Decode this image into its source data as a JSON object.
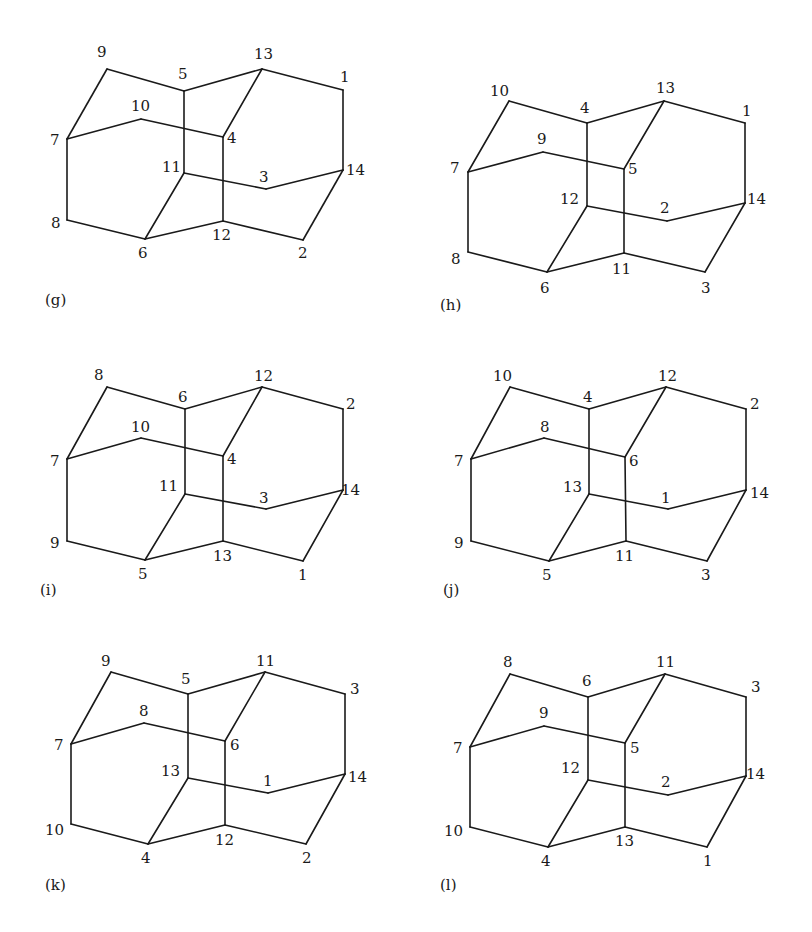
{
  "figure": {
    "edges_template": [
      [
        "A",
        "B"
      ],
      [
        "A",
        "C"
      ],
      [
        "C",
        "D"
      ],
      [
        "D",
        "E"
      ],
      [
        "E",
        "F"
      ],
      [
        "B",
        "G"
      ],
      [
        "G",
        "H"
      ],
      [
        "H",
        "D"
      ],
      [
        "C",
        "I"
      ],
      [
        "B",
        "J"
      ],
      [
        "J",
        "K"
      ],
      [
        "K",
        "I"
      ],
      [
        "I",
        "L"
      ],
      [
        "L",
        "F"
      ],
      [
        "F",
        "M"
      ],
      [
        "M",
        "N"
      ],
      [
        "N",
        "K"
      ],
      [
        "H",
        "N"
      ]
    ],
    "panels": [
      {
        "id": "g",
        "label": "(g)",
        "label_pos": [
          45,
          305
        ],
        "vertices": {
          "A": {
            "n": "9",
            "x": 107,
            "y": 69,
            "lx": 97,
            "ly": 57
          },
          "C": {
            "n": "5",
            "x": 184,
            "y": 91,
            "lx": 178,
            "ly": 79
          },
          "D": {
            "n": "13",
            "x": 262,
            "y": 69,
            "lx": 254,
            "ly": 59
          },
          "E": {
            "n": "1",
            "x": 343,
            "y": 90,
            "lx": 340,
            "ly": 82
          },
          "B": {
            "n": "7",
            "x": 67,
            "y": 139,
            "lx": 50,
            "ly": 145
          },
          "G": {
            "n": "10",
            "x": 141,
            "y": 119,
            "lx": 131,
            "ly": 111
          },
          "H": {
            "n": "4",
            "x": 223,
            "y": 137,
            "lx": 227,
            "ly": 143
          },
          "I": {
            "n": "11",
            "x": 184,
            "y": 173,
            "lx": 162,
            "ly": 172
          },
          "L": {
            "n": "3",
            "x": 266,
            "y": 189,
            "lx": 259,
            "ly": 182
          },
          "F": {
            "n": "14",
            "x": 343,
            "y": 170,
            "lx": 346,
            "ly": 175
          },
          "J": {
            "n": "8",
            "x": 67,
            "y": 220,
            "lx": 51,
            "ly": 228
          },
          "K": {
            "n": "6",
            "x": 145,
            "y": 239,
            "lx": 138,
            "ly": 258
          },
          "N": {
            "n": "12",
            "x": 223,
            "y": 221,
            "lx": 212,
            "ly": 240
          },
          "M": {
            "n": "2",
            "x": 303,
            "y": 240,
            "lx": 298,
            "ly": 258
          }
        }
      },
      {
        "id": "h",
        "label": "(h)",
        "label_pos": [
          440,
          310
        ],
        "vertices": {
          "A": {
            "n": "10",
            "x": 509,
            "y": 101,
            "lx": 490,
            "ly": 96
          },
          "C": {
            "n": "4",
            "x": 587,
            "y": 123,
            "lx": 580,
            "ly": 113
          },
          "D": {
            "n": "13",
            "x": 664,
            "y": 101,
            "lx": 656,
            "ly": 93
          },
          "E": {
            "n": "1",
            "x": 745,
            "y": 123,
            "lx": 742,
            "ly": 116
          },
          "B": {
            "n": "7",
            "x": 468,
            "y": 172,
            "lx": 450,
            "ly": 173
          },
          "G": {
            "n": "9",
            "x": 543,
            "y": 152,
            "lx": 537,
            "ly": 144
          },
          "H": {
            "n": "5",
            "x": 624,
            "y": 169,
            "lx": 628,
            "ly": 174
          },
          "I": {
            "n": "12",
            "x": 587,
            "y": 206,
            "lx": 560,
            "ly": 204
          },
          "L": {
            "n": "2",
            "x": 667,
            "y": 221,
            "lx": 660,
            "ly": 213
          },
          "F": {
            "n": "14",
            "x": 745,
            "y": 203,
            "lx": 747,
            "ly": 204
          },
          "J": {
            "n": "8",
            "x": 468,
            "y": 252,
            "lx": 451,
            "ly": 264
          },
          "K": {
            "n": "6",
            "x": 547,
            "y": 272,
            "lx": 540,
            "ly": 293
          },
          "N": {
            "n": "11",
            "x": 624,
            "y": 253,
            "lx": 612,
            "ly": 274
          },
          "M": {
            "n": "3",
            "x": 705,
            "y": 272,
            "lx": 701,
            "ly": 293
          }
        }
      },
      {
        "id": "i",
        "label": "(i)",
        "label_pos": [
          40,
          595
        ],
        "vertices": {
          "A": {
            "n": "8",
            "x": 107,
            "y": 387,
            "lx": 94,
            "ly": 380
          },
          "C": {
            "n": "6",
            "x": 185,
            "y": 409,
            "lx": 178,
            "ly": 402
          },
          "D": {
            "n": "12",
            "x": 262,
            "y": 387,
            "lx": 254,
            "ly": 381
          },
          "E": {
            "n": "2",
            "x": 343,
            "y": 409,
            "lx": 346,
            "ly": 409
          },
          "B": {
            "n": "7",
            "x": 67,
            "y": 459,
            "lx": 50,
            "ly": 466
          },
          "G": {
            "n": "10",
            "x": 141,
            "y": 438,
            "lx": 131,
            "ly": 432
          },
          "H": {
            "n": "4",
            "x": 223,
            "y": 456,
            "lx": 227,
            "ly": 464
          },
          "I": {
            "n": "11",
            "x": 185,
            "y": 494,
            "lx": 159,
            "ly": 491
          },
          "L": {
            "n": "3",
            "x": 266,
            "y": 509,
            "lx": 259,
            "ly": 503
          },
          "F": {
            "n": "14",
            "x": 343,
            "y": 490,
            "lx": 341,
            "ly": 495
          },
          "J": {
            "n": "9",
            "x": 67,
            "y": 541,
            "lx": 50,
            "ly": 548
          },
          "K": {
            "n": "5",
            "x": 145,
            "y": 560,
            "lx": 138,
            "ly": 579
          },
          "N": {
            "n": "13",
            "x": 223,
            "y": 541,
            "lx": 213,
            "ly": 561
          },
          "M": {
            "n": "1",
            "x": 303,
            "y": 561,
            "lx": 298,
            "ly": 580
          }
        }
      },
      {
        "id": "j",
        "label": "(j)",
        "label_pos": [
          443,
          595
        ],
        "vertices": {
          "A": {
            "n": "10",
            "x": 510,
            "y": 387,
            "lx": 493,
            "ly": 381
          },
          "C": {
            "n": "4",
            "x": 589,
            "y": 409,
            "lx": 583,
            "ly": 402
          },
          "D": {
            "n": "12",
            "x": 666,
            "y": 387,
            "lx": 658,
            "ly": 381
          },
          "E": {
            "n": "2",
            "x": 746,
            "y": 409,
            "lx": 750,
            "ly": 409
          },
          "B": {
            "n": "7",
            "x": 471,
            "y": 459,
            "lx": 454,
            "ly": 466
          },
          "G": {
            "n": "8",
            "x": 544,
            "y": 438,
            "lx": 540,
            "ly": 432
          },
          "H": {
            "n": "6",
            "x": 625,
            "y": 457,
            "lx": 629,
            "ly": 466
          },
          "I": {
            "n": "13",
            "x": 589,
            "y": 494,
            "lx": 563,
            "ly": 492
          },
          "L": {
            "n": "1",
            "x": 668,
            "y": 509,
            "lx": 661,
            "ly": 503
          },
          "F": {
            "n": "14",
            "x": 746,
            "y": 490,
            "lx": 750,
            "ly": 498
          },
          "J": {
            "n": "9",
            "x": 471,
            "y": 541,
            "lx": 454,
            "ly": 548
          },
          "K": {
            "n": "5",
            "x": 549,
            "y": 561,
            "lx": 542,
            "ly": 580
          },
          "N": {
            "n": "11",
            "x": 626,
            "y": 541,
            "lx": 615,
            "ly": 561
          },
          "M": {
            "n": "3",
            "x": 707,
            "y": 561,
            "lx": 701,
            "ly": 580
          }
        }
      },
      {
        "id": "k",
        "label": "(k)",
        "label_pos": [
          45,
          890
        ],
        "vertices": {
          "A": {
            "n": "9",
            "x": 111,
            "y": 672,
            "lx": 101,
            "ly": 666
          },
          "C": {
            "n": "5",
            "x": 188,
            "y": 694,
            "lx": 181,
            "ly": 684
          },
          "D": {
            "n": "11",
            "x": 265,
            "y": 672,
            "lx": 256,
            "ly": 666
          },
          "E": {
            "n": "3",
            "x": 345,
            "y": 694,
            "lx": 350,
            "ly": 694
          },
          "B": {
            "n": "7",
            "x": 71,
            "y": 744,
            "lx": 54,
            "ly": 750
          },
          "G": {
            "n": "8",
            "x": 144,
            "y": 723,
            "lx": 139,
            "ly": 716
          },
          "H": {
            "n": "6",
            "x": 225,
            "y": 741,
            "lx": 230,
            "ly": 750
          },
          "I": {
            "n": "13",
            "x": 188,
            "y": 778,
            "lx": 161,
            "ly": 776
          },
          "L": {
            "n": "1",
            "x": 268,
            "y": 793,
            "lx": 263,
            "ly": 786
          },
          "F": {
            "n": "14",
            "x": 345,
            "y": 774,
            "lx": 348,
            "ly": 782
          },
          "J": {
            "n": "10",
            "x": 71,
            "y": 824,
            "lx": 45,
            "ly": 835
          },
          "K": {
            "n": "4",
            "x": 148,
            "y": 844,
            "lx": 141,
            "ly": 863
          },
          "N": {
            "n": "12",
            "x": 225,
            "y": 825,
            "lx": 215,
            "ly": 845
          },
          "M": {
            "n": "2",
            "x": 306,
            "y": 844,
            "lx": 302,
            "ly": 863
          }
        }
      },
      {
        "id": "l",
        "label": "(l)",
        "label_pos": [
          440,
          890
        ],
        "vertices": {
          "A": {
            "n": "8",
            "x": 510,
            "y": 674,
            "lx": 503,
            "ly": 667
          },
          "C": {
            "n": "6",
            "x": 588,
            "y": 697,
            "lx": 582,
            "ly": 686
          },
          "D": {
            "n": "11",
            "x": 665,
            "y": 674,
            "lx": 656,
            "ly": 667
          },
          "E": {
            "n": "3",
            "x": 746,
            "y": 697,
            "lx": 751,
            "ly": 692
          },
          "B": {
            "n": "7",
            "x": 470,
            "y": 747,
            "lx": 453,
            "ly": 753
          },
          "G": {
            "n": "9",
            "x": 544,
            "y": 726,
            "lx": 539,
            "ly": 718
          },
          "H": {
            "n": "5",
            "x": 625,
            "y": 743,
            "lx": 630,
            "ly": 753
          },
          "I": {
            "n": "12",
            "x": 588,
            "y": 780,
            "lx": 561,
            "ly": 773
          },
          "L": {
            "n": "2",
            "x": 668,
            "y": 795,
            "lx": 661,
            "ly": 787
          },
          "F": {
            "n": "14",
            "x": 746,
            "y": 776,
            "lx": 746,
            "ly": 779
          },
          "J": {
            "n": "10",
            "x": 470,
            "y": 827,
            "lx": 444,
            "ly": 836
          },
          "K": {
            "n": "4",
            "x": 548,
            "y": 847,
            "lx": 541,
            "ly": 866
          },
          "N": {
            "n": "13",
            "x": 625,
            "y": 827,
            "lx": 615,
            "ly": 846
          },
          "M": {
            "n": "1",
            "x": 707,
            "y": 847,
            "lx": 703,
            "ly": 866
          }
        }
      }
    ]
  }
}
